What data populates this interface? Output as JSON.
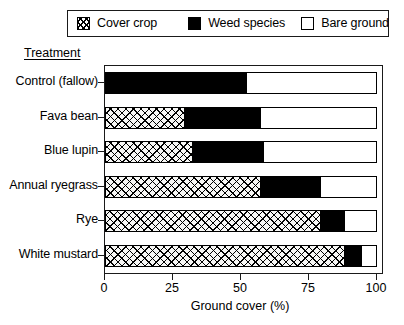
{
  "legend": {
    "entries": [
      {
        "label": "Cover crop",
        "swatch": "hatched-square-icon"
      },
      {
        "label": "Weed species",
        "swatch": "filled-square-icon"
      },
      {
        "label": "Bare ground",
        "swatch": "empty-square-icon"
      }
    ]
  },
  "axes": {
    "y_heading": "Treatment",
    "x_title": "Ground cover (%)",
    "x_ticks": [
      "0",
      "25",
      "50",
      "75",
      "100"
    ]
  },
  "chart_data": {
    "type": "bar",
    "orientation": "horizontal",
    "stacked": true,
    "title": "",
    "xlabel": "Ground cover (%)",
    "ylabel": "Treatment",
    "xlim": [
      0,
      100
    ],
    "grid": false,
    "legend_position": "top",
    "categories": [
      "Control (fallow)",
      "Fava bean",
      "Blue lupin",
      "Annual ryegrass",
      "Rye",
      "White mustard"
    ],
    "series": [
      {
        "name": "Cover crop",
        "values": [
          0,
          29,
          32,
          57,
          79,
          88
        ],
        "fill": "hatched"
      },
      {
        "name": "Weed species",
        "values": [
          52,
          28,
          26,
          22,
          9,
          6
        ],
        "fill": "black"
      },
      {
        "name": "Bare ground",
        "values": [
          48,
          43,
          42,
          21,
          12,
          6
        ],
        "fill": "white"
      }
    ]
  },
  "colors": {
    "ink": "#000000",
    "frame": "#1a1a1a",
    "background": "#ffffff"
  }
}
